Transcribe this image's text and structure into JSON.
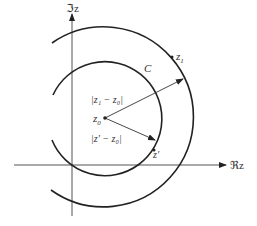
{
  "diagram": {
    "axes": {
      "imag_label": "ℑz",
      "real_label": "ℜz"
    },
    "contour_label": "C",
    "points": {
      "center": "z",
      "center_sub": "0",
      "outer_point": "z",
      "outer_point_sub": "1",
      "inner_point": "z′"
    },
    "distances": {
      "outer": "|z₁ − z₀|",
      "inner": "|z′ − z₀|"
    },
    "colors": {
      "stroke": "#222222",
      "text": "#333333"
    }
  }
}
